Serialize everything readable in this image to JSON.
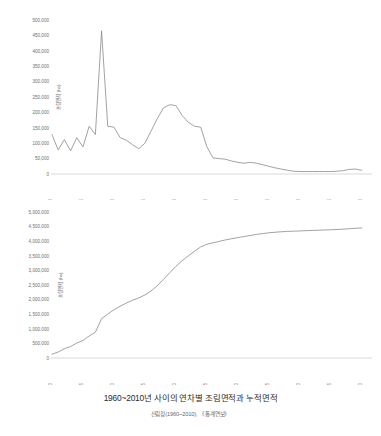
{
  "caption": {
    "title": "1960~2010년 사이의 연차별 조림면적과 누적면적",
    "source": "산림청(1960~2010), 《통계연보》"
  },
  "colors": {
    "line": "#8a8a8a",
    "axis": "#c9c9c9",
    "tick_text": "#6e6e6e",
    "caption_title": "#2b2b2b",
    "caption_source": "#6b6b6b",
    "background": "#ffffff"
  },
  "chart_data": [
    {
      "type": "line",
      "id": "annual-afforestation",
      "title": "",
      "xlabel": "",
      "ylabel": "조림면적 (ha)",
      "ylim": [
        0,
        500000
      ],
      "xlim": [
        1960,
        2011
      ],
      "grid": false,
      "legend": false,
      "ytick_labels": [
        "0",
        "50,000",
        "100,000",
        "150,000",
        "200,000",
        "250,000",
        "300,000",
        "350,000",
        "400,000",
        "450,000",
        "500,000"
      ],
      "ytick_values": [
        0,
        50000,
        100000,
        150000,
        200000,
        250000,
        300000,
        350000,
        400000,
        450000,
        500000
      ],
      "xtick_labels": [
        "1960",
        "1965",
        "1970",
        "1975",
        "1980",
        "1985",
        "1990",
        "1995",
        "2000",
        "2005",
        "2010"
      ],
      "xtick_values": [
        1960,
        1965,
        1970,
        1975,
        1980,
        1985,
        1990,
        1995,
        2000,
        2005,
        2010
      ],
      "x": [
        1960,
        1961,
        1962,
        1963,
        1964,
        1965,
        1966,
        1967,
        1968,
        1969,
        1970,
        1971,
        1972,
        1973,
        1974,
        1975,
        1976,
        1977,
        1978,
        1979,
        1980,
        1981,
        1982,
        1983,
        1984,
        1985,
        1986,
        1987,
        1988,
        1989,
        1990,
        1991,
        1992,
        1993,
        1994,
        1995,
        1996,
        1997,
        1998,
        1999,
        2000,
        2001,
        2002,
        2003,
        2004,
        2005,
        2006,
        2007,
        2008,
        2009,
        2010
      ],
      "values": [
        128000,
        78000,
        112000,
        75000,
        118000,
        88000,
        155000,
        128000,
        465000,
        155000,
        152000,
        118000,
        110000,
        95000,
        82000,
        100000,
        140000,
        180000,
        215000,
        225000,
        222000,
        190000,
        168000,
        155000,
        152000,
        88000,
        52000,
        50000,
        48000,
        42000,
        38000,
        35000,
        38000,
        35000,
        30000,
        25000,
        20000,
        16000,
        12000,
        9000,
        8000,
        8000,
        8000,
        8000,
        8000,
        8000,
        9000,
        11000,
        15000,
        16000,
        12000
      ]
    },
    {
      "type": "line",
      "id": "cumulative-afforestation",
      "title": "",
      "xlabel": "",
      "ylabel": "조림면적 (ha)",
      "ylim": [
        0,
        5000000
      ],
      "xlim": [
        1960,
        2011
      ],
      "grid": false,
      "legend": false,
      "ytick_labels": [
        "0",
        "500,000",
        "1,000,000",
        "1,500,000",
        "2,000,000",
        "2,500,000",
        "3,000,000",
        "3,500,000",
        "4,000,000",
        "4,500,000",
        "5,000,000"
      ],
      "ytick_values": [
        0,
        500000,
        1000000,
        1500000,
        2000000,
        2500000,
        3000000,
        3500000,
        4000000,
        4500000,
        5000000
      ],
      "xtick_labels": [
        "1960",
        "1965",
        "1970",
        "1975",
        "1980",
        "1985",
        "1990",
        "1995",
        "2000",
        "2005",
        "2010"
      ],
      "xtick_values": [
        1960,
        1965,
        1970,
        1975,
        1980,
        1985,
        1990,
        1995,
        2000,
        2005,
        2010
      ],
      "x": [
        1960,
        1961,
        1962,
        1963,
        1964,
        1965,
        1966,
        1967,
        1968,
        1969,
        1970,
        1971,
        1972,
        1973,
        1974,
        1975,
        1976,
        1977,
        1978,
        1979,
        1980,
        1981,
        1982,
        1983,
        1984,
        1985,
        1986,
        1987,
        1988,
        1989,
        1990,
        1991,
        1992,
        1993,
        1994,
        1995,
        1996,
        1997,
        1998,
        1999,
        2000,
        2001,
        2002,
        2003,
        2004,
        2005,
        2006,
        2007,
        2008,
        2009,
        2010
      ],
      "values": [
        128000,
        206000,
        318000,
        393000,
        511000,
        599000,
        754000,
        882000,
        1347000,
        1502000,
        1654000,
        1772000,
        1882000,
        1977000,
        2059000,
        2159000,
        2299000,
        2479000,
        2694000,
        2919000,
        3141000,
        3331000,
        3499000,
        3654000,
        3806000,
        3894000,
        3946000,
        3996000,
        4044000,
        4086000,
        4124000,
        4159000,
        4197000,
        4232000,
        4262000,
        4287000,
        4307000,
        4323000,
        4335000,
        4344000,
        4352000,
        4360000,
        4368000,
        4376000,
        4384000,
        4392000,
        4401000,
        4412000,
        4427000,
        4443000,
        4455000
      ]
    }
  ]
}
